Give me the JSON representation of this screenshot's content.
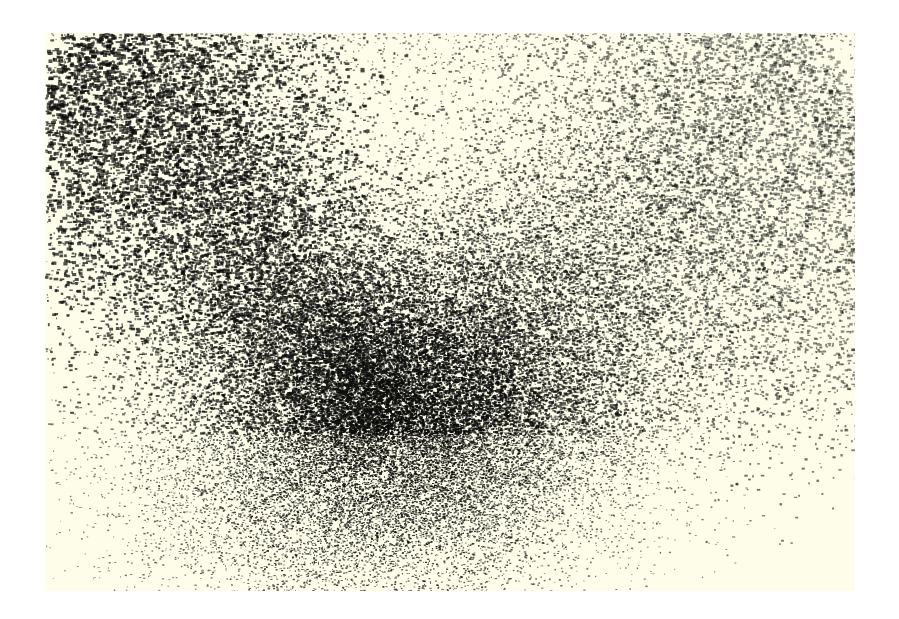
{
  "page": {
    "background_color": "#ffffff"
  },
  "artwork": {
    "type": "stipple-particle-field",
    "frame": {
      "x": 45,
      "y": 33,
      "width": 810,
      "height": 558
    },
    "background_color": "#fdfdea",
    "ink_color": "#0d0d0d",
    "core": {
      "x": 345,
      "y": 400,
      "spread_x": 120,
      "spread_y": 110
    },
    "plume_left": {
      "from": [
        345,
        400
      ],
      "to": [
        30,
        0
      ],
      "width": 190
    },
    "plume_right": {
      "from": [
        345,
        400
      ],
      "to": [
        810,
        60
      ],
      "width": 260
    },
    "particle_counts": {
      "core": 26000,
      "plume_left": 14000,
      "plume_right": 16000,
      "scatter": 3000
    },
    "seed": 1337
  }
}
